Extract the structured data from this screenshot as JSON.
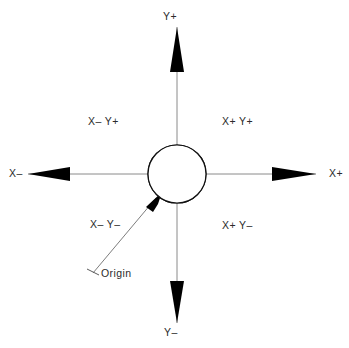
{
  "diagram": {
    "background_color": "#ffffff",
    "axis_color": "#8a8a8a",
    "arrow_color": "#000000",
    "text_color": "#2b2b2b",
    "origin": {
      "x": 177,
      "y": 174
    },
    "axis_labels": {
      "y_positive": "Y+",
      "y_negative": "Y–",
      "x_negative": "X–",
      "x_positive": "X+"
    },
    "quadrant_labels": {
      "upper_left": "X– Y+",
      "upper_right": "X+ Y+",
      "lower_left": "X– Y–",
      "lower_right": "X+ Y–"
    },
    "callout": {
      "label": "Origin",
      "leader_from": {
        "x": 93,
        "y": 273
      },
      "leader_to": {
        "x": 160,
        "y": 194
      }
    },
    "target_marker": {
      "radius": 29,
      "filled_quadrants": [
        "upper-right",
        "lower-left"
      ],
      "empty_quadrants": [
        "upper-left",
        "lower-right"
      ],
      "fill_color": "#000000",
      "outline_color": "#111111"
    }
  }
}
